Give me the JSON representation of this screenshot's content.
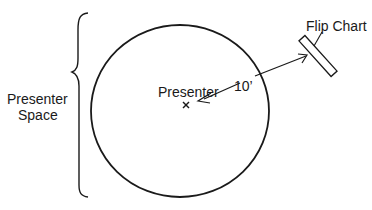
{
  "diagram": {
    "type": "room-layout",
    "labels": {
      "presenter_space": [
        "Presenter",
        "Space"
      ],
      "presenter": "Presenter",
      "presenter_marker": "×",
      "distance": "10’",
      "flip_chart": "Flip Chart"
    },
    "colors": {
      "stroke": "#1a1a1a",
      "background": "#ffffff"
    }
  }
}
